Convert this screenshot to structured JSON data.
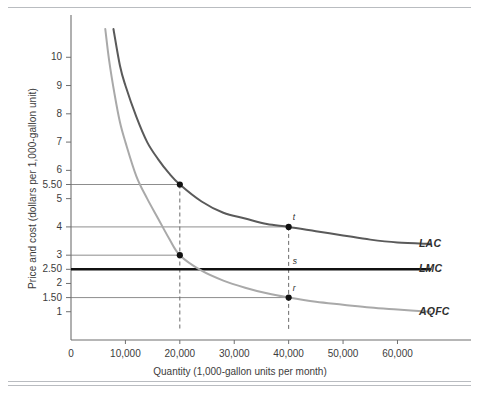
{
  "figure": {
    "background_color": "#ffffff",
    "rule_color": "#b9bcc0"
  },
  "chart_data": {
    "type": "line",
    "title": "",
    "xlabel": "Quantity (1,000-gallon units per month)",
    "ylabel": "Price and cost (dollars per 1,000-gallon unit)",
    "xlim": [
      0,
      68000
    ],
    "ylim": [
      0,
      11
    ],
    "grid": false,
    "legend_position": "right-of-plot-at-curve-ends",
    "x_ticks": [
      0,
      10000,
      20000,
      30000,
      40000,
      50000,
      60000
    ],
    "x_tick_labels": [
      "0",
      "10,000",
      "20,000",
      "30,000",
      "40,000",
      "50,000",
      "60,000"
    ],
    "y_ticks": [
      1,
      1.5,
      2,
      2.5,
      3,
      4,
      5,
      5.5,
      6,
      7,
      8,
      9,
      10
    ],
    "y_tick_labels": [
      "1",
      "1.50",
      "2",
      "2.50",
      "3",
      "4",
      "5",
      "5.50",
      "6",
      "7",
      "8",
      "9",
      "10"
    ],
    "series": [
      {
        "name": "LAC",
        "label": "LAC",
        "color": "#5a5a5a",
        "style": "solid",
        "width": 2.0,
        "description": "Long-run average cost, downward sloping hyperbola approaching about 3.4",
        "points": [
          {
            "x": 7800,
            "y": 11.0
          },
          {
            "x": 9000,
            "y": 9.7
          },
          {
            "x": 10000,
            "y": 9.0
          },
          {
            "x": 12000,
            "y": 7.9
          },
          {
            "x": 14000,
            "y": 7.0
          },
          {
            "x": 16000,
            "y": 6.4
          },
          {
            "x": 18000,
            "y": 5.9
          },
          {
            "x": 20000,
            "y": 5.5
          },
          {
            "x": 24000,
            "y": 4.9
          },
          {
            "x": 28000,
            "y": 4.5
          },
          {
            "x": 32000,
            "y": 4.3
          },
          {
            "x": 36000,
            "y": 4.1
          },
          {
            "x": 40000,
            "y": 4.0
          },
          {
            "x": 45000,
            "y": 3.85
          },
          {
            "x": 50000,
            "y": 3.7
          },
          {
            "x": 55000,
            "y": 3.55
          },
          {
            "x": 60000,
            "y": 3.45
          },
          {
            "x": 66000,
            "y": 3.4
          }
        ]
      },
      {
        "name": "LMC",
        "label": "LMC",
        "color": "#111111",
        "style": "solid",
        "width": 2.6,
        "description": "Long-run marginal cost, constant horizontal line at 2.50",
        "points": [
          {
            "x": 0,
            "y": 2.5
          },
          {
            "x": 66000,
            "y": 2.5
          }
        ]
      },
      {
        "name": "AQFC",
        "label": "AQFC",
        "color": "#a9a9a9",
        "style": "solid",
        "width": 2.0,
        "description": "Average quasi-fixed cost, downward sloping hyperbola approaching about 1.0",
        "points": [
          {
            "x": 6300,
            "y": 11.0
          },
          {
            "x": 7000,
            "y": 9.9
          },
          {
            "x": 8000,
            "y": 8.7
          },
          {
            "x": 9000,
            "y": 7.7
          },
          {
            "x": 10000,
            "y": 7.0
          },
          {
            "x": 12000,
            "y": 5.8
          },
          {
            "x": 14000,
            "y": 5.0
          },
          {
            "x": 16000,
            "y": 4.3
          },
          {
            "x": 18000,
            "y": 3.6
          },
          {
            "x": 20000,
            "y": 3.0
          },
          {
            "x": 24000,
            "y": 2.45
          },
          {
            "x": 28000,
            "y": 2.1
          },
          {
            "x": 32000,
            "y": 1.85
          },
          {
            "x": 36000,
            "y": 1.65
          },
          {
            "x": 40000,
            "y": 1.5
          },
          {
            "x": 45000,
            "y": 1.35
          },
          {
            "x": 50000,
            "y": 1.25
          },
          {
            "x": 55000,
            "y": 1.15
          },
          {
            "x": 60000,
            "y": 1.08
          },
          {
            "x": 66000,
            "y": 1.0
          }
        ]
      }
    ],
    "markers": [
      {
        "x": 20000,
        "y": 5.5,
        "label": "",
        "series": "LAC"
      },
      {
        "x": 20000,
        "y": 3.0,
        "label": "",
        "series": "AQFC"
      },
      {
        "x": 40000,
        "y": 4.0,
        "label": "t",
        "series": "LAC"
      },
      {
        "x": 40000,
        "y": 1.5,
        "label": "r",
        "series": "AQFC"
      }
    ],
    "annotations": [
      {
        "x": 40000,
        "y": 2.5,
        "label": "s",
        "note": "intersection of 40,000 drop-line with LMC"
      }
    ],
    "guide_lines": {
      "horizontal_values": [
        5.5,
        4.0,
        3.0,
        1.5
      ],
      "vertical_values": [
        20000,
        40000
      ],
      "vertical_style": "dashed",
      "horizontal_style": "solid-thin",
      "color": "#808080"
    }
  }
}
